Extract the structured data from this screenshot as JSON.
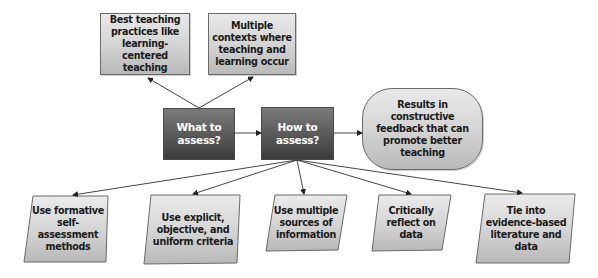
{
  "diagram": {
    "top_boxes": [
      {
        "id": "best-practices",
        "text": "Best teaching practices like learning-centered teaching"
      },
      {
        "id": "multiple-contexts",
        "text": "Multiple contexts where teaching and learning occur"
      }
    ],
    "center_boxes": [
      {
        "id": "what-to-assess",
        "text": "What to assess?"
      },
      {
        "id": "how-to-assess",
        "text": "How to assess?"
      }
    ],
    "result_box": {
      "id": "results",
      "text": "Results in constructive feedback that can promote better teaching"
    },
    "bottom_boxes": [
      {
        "id": "formative",
        "text": "Use formative self-assessment methods"
      },
      {
        "id": "explicit-criteria",
        "text": "Use explicit, objective, and uniform criteria"
      },
      {
        "id": "multiple-sources",
        "text": "Use multiple sources of information"
      },
      {
        "id": "reflect",
        "text": "Critically reflect on data"
      },
      {
        "id": "evidence-based",
        "text": "Tie into evidence-based literature and data"
      }
    ],
    "colors": {
      "light_box_top": "#e9e9e9",
      "light_box_bottom": "#b9b9b9",
      "dark_box_top": "#7a7a7a",
      "dark_box_bottom": "#3c3c3c",
      "arrow": "#333333"
    }
  }
}
